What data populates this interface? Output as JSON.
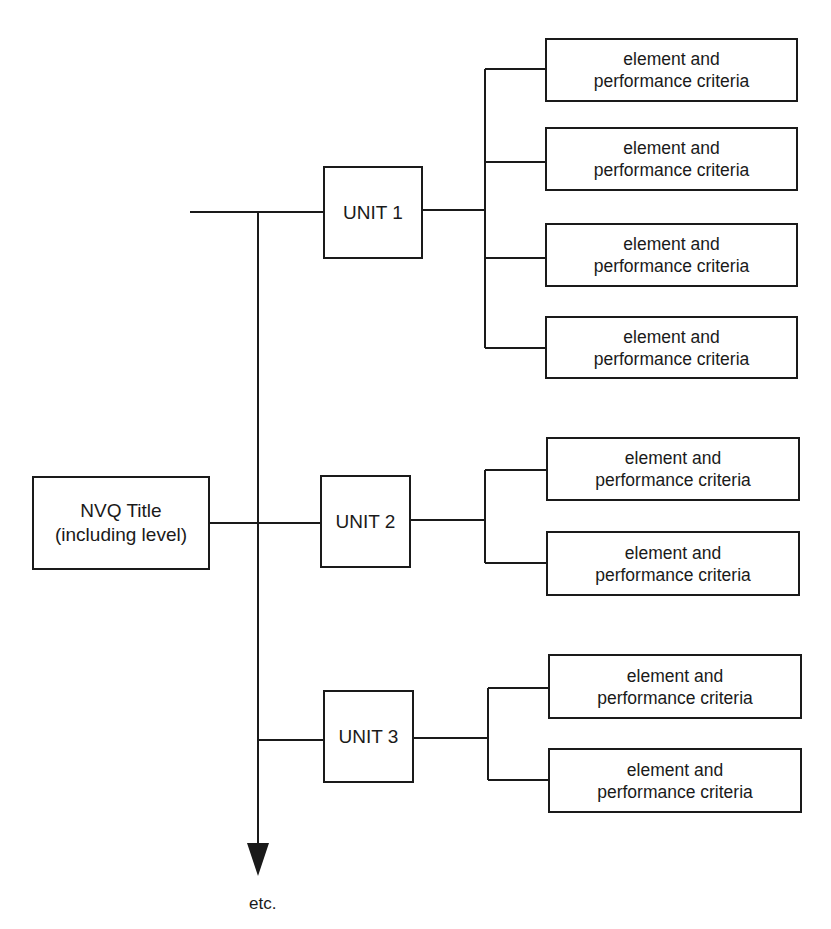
{
  "diagram": {
    "root": {
      "title_line1": "NVQ Title",
      "title_line2": "(including level)"
    },
    "units": [
      {
        "label": "UNIT 1",
        "elements": [
          {
            "line1": "element and",
            "line2": "performance criteria"
          },
          {
            "line1": "element and",
            "line2": "performance criteria"
          },
          {
            "line1": "element and",
            "line2": "performance criteria"
          },
          {
            "line1": "element and",
            "line2": "performance criteria"
          }
        ]
      },
      {
        "label": "UNIT 2",
        "elements": [
          {
            "line1": "element and",
            "line2": "performance criteria"
          },
          {
            "line1": "element and",
            "line2": "performance criteria"
          }
        ]
      },
      {
        "label": "UNIT 3",
        "elements": [
          {
            "line1": "element and",
            "line2": "performance criteria"
          },
          {
            "line1": "element and",
            "line2": "performance criteria"
          }
        ]
      }
    ],
    "continuation_label": "etc.",
    "colors": {
      "line": "#1a1a1a",
      "background": "#ffffff"
    }
  }
}
